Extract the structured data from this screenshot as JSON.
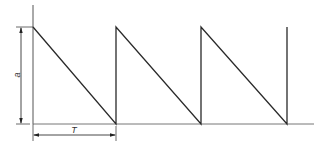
{
  "diagram": {
    "type": "sawtooth-waveform",
    "colors": {
      "line": "#2a2a2a",
      "axis": "#555555",
      "background": "#ffffff"
    },
    "labels": {
      "amplitude": "a",
      "period": "T"
    },
    "geometry": {
      "origin": [
        33,
        124
      ],
      "axis_top": 5,
      "axis_right": 314,
      "peak_y": 27,
      "teeth_x": [
        33,
        116,
        201,
        287
      ]
    }
  }
}
